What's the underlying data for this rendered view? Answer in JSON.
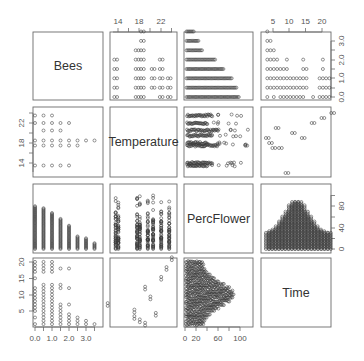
{
  "chart_data": {
    "type": "scatter",
    "subtype": "pairs-matrix",
    "title": "",
    "variables": [
      "Bees",
      "Temperature",
      "PercFlower",
      "Time"
    ],
    "layout": {
      "rows": 4,
      "cols": 4,
      "diagonal": "variable-names",
      "point_symbol": "open-circle",
      "grid": false,
      "axes": {
        "top": [
          {
            "col": 2,
            "var": "Temperature",
            "ticks": [
              14,
              18,
              22
            ]
          },
          {
            "col": 4,
            "var": "Time",
            "ticks": [
              5,
              10,
              15,
              20
            ]
          }
        ],
        "bottom": [
          {
            "col": 1,
            "var": "Bees",
            "ticks": [
              "0.0",
              "1.0",
              "2.0",
              "3.0"
            ]
          },
          {
            "col": 3,
            "var": "PercFlower",
            "ticks": [
              0,
              20,
              60,
              100
            ]
          }
        ],
        "left": [
          {
            "row": 2,
            "var": "Temperature",
            "ticks": [
              14,
              18,
              22
            ]
          },
          {
            "row": 4,
            "var": "Time",
            "ticks": [
              5,
              10,
              15,
              20
            ]
          }
        ],
        "right": [
          {
            "row": 1,
            "var": "Bees",
            "ticks": [
              "0.0",
              "1.0",
              "2.0",
              "3.0"
            ]
          },
          {
            "row": 3,
            "var": "PercFlower",
            "ticks": [
              0,
              40,
              80
            ]
          }
        ]
      }
    },
    "ranges": {
      "Bees": [
        0,
        3.5
      ],
      "Temperature": [
        13,
        24
      ],
      "PercFlower": [
        0,
        115
      ],
      "Time": [
        0,
        21
      ]
    },
    "series": [
      {
        "name": "Time vs Temperature (observed session pairs)",
        "points": [
          [
            1,
            19
          ],
          [
            2,
            18
          ],
          [
            3,
            17
          ],
          [
            4,
            21
          ],
          [
            5,
            17
          ],
          [
            7,
            12
          ],
          [
            9,
            20
          ],
          [
            12,
            19
          ],
          [
            15,
            22
          ],
          [
            18,
            23
          ],
          [
            21,
            24
          ]
        ]
      },
      {
        "name": "Bees vs Temperature (observed levels)",
        "bees_levels": [
          0,
          0.5,
          1.0,
          1.5,
          2.0,
          2.5,
          3.0,
          3.5
        ],
        "temperature_levels": [
          13.5,
          17.5,
          18.5,
          19.5,
          20.5,
          22,
          23.5
        ]
      }
    ]
  },
  "panels": {
    "diag_1": "Bees",
    "diag_2": "Temperature",
    "diag_3": "PercFlower",
    "diag_4": "Time"
  },
  "ticks": {
    "temp_top": [
      "14",
      "18",
      "22"
    ],
    "time_top": [
      "5",
      "10",
      "15",
      "20"
    ],
    "bees_right": [
      "0.0",
      "1.0",
      "2.0",
      "3.0"
    ],
    "temp_left": [
      "14",
      "18",
      "22"
    ],
    "perc_right": [
      "0",
      "40",
      "80"
    ],
    "time_left": [
      "5",
      "10",
      "15",
      "20"
    ],
    "bees_bottom": [
      "0.0",
      "1.0",
      "2.0",
      "3.0"
    ],
    "perc_bottom": [
      "0",
      "20",
      "60",
      "100"
    ]
  }
}
